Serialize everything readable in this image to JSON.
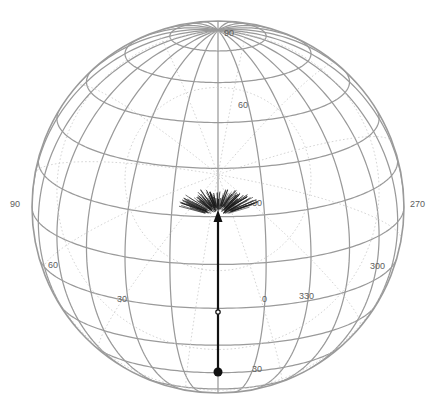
{
  "figure": {
    "type": "orthographic-globe-projection",
    "background_color": "#ffffff",
    "grid_color": "#9a9a9a",
    "dotted_grid_color": "#c9c9c9",
    "vector_color": "#111111",
    "label_color": "#5d5d5d",
    "center_x": 218,
    "center_y": 207,
    "radius": 186
  },
  "chart_data": {
    "type": "scatter",
    "title": "",
    "xlabel": "",
    "ylabel": "",
    "projection": "orthographic",
    "grid": true,
    "legend": "none",
    "graticule": {
      "meridian_step_deg": 15,
      "parallel_step_deg": 15,
      "primary_style": "solid",
      "secondary_style": "dotted"
    },
    "axis_tick_labels": [
      {
        "text": "90",
        "x": 228,
        "y": 33,
        "role": "pole-latitude"
      },
      {
        "text": "90",
        "x": 12,
        "y": 203,
        "role": "left-longitude"
      },
      {
        "text": "270",
        "x": 412,
        "y": 203,
        "role": "right-longitude"
      },
      {
        "text": "60",
        "x": 238,
        "y": 105,
        "role": "latitude"
      },
      {
        "text": "30",
        "x": 253,
        "y": 200,
        "role": "latitude"
      },
      {
        "text": "60",
        "x": 48,
        "y": 264,
        "role": "longitude"
      },
      {
        "text": "30",
        "x": 117,
        "y": 298,
        "role": "longitude"
      },
      {
        "text": "0",
        "x": 262,
        "y": 298,
        "role": "longitude"
      },
      {
        "text": "330",
        "x": 300,
        "y": 295,
        "role": "longitude"
      },
      {
        "text": "300",
        "x": 370,
        "y": 265,
        "role": "longitude"
      },
      {
        "text": "30",
        "x": 253,
        "y": 368,
        "role": "latitude"
      }
    ],
    "vector_overlay": {
      "name": "displacement-vector",
      "tail_x": 218,
      "tail_y": 372,
      "head_x": 218,
      "head_y": 216,
      "tail_marker": "filled-circle",
      "tail_marker_radius": 4.5,
      "midpoint_marker_x": 218,
      "midpoint_marker_y": 312,
      "line_width": 2.2,
      "color": "#111111"
    },
    "point_cluster": {
      "name": "uncertainty-fan",
      "center_x": 218,
      "center_y": 210,
      "spread_x": 42,
      "spread_y": 14,
      "count": 140,
      "color": "#1c1c1c",
      "description": "dense fan-shaped swarm of short radiating segments at vector head"
    }
  },
  "labels": {
    "pole_90": "90",
    "left_90": "90",
    "right_270": "270",
    "lat_60": "60",
    "lat_30": "30",
    "lon_60": "60",
    "lon_30": "30",
    "lon_0": "0",
    "lon_330": "330",
    "lon_300": "300",
    "lat_30_bottom": "30"
  }
}
